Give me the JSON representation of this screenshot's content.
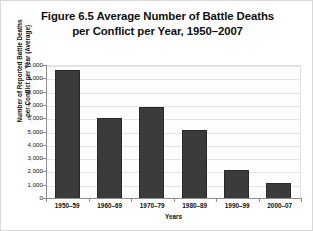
{
  "chart_data": {
    "type": "bar",
    "title": "Figure 6.5 Average Number of Battle Deaths per Conflict per Year, 1950–2007",
    "title_lines": [
      "Figure 6.5 Average Number of Battle Deaths",
      "per Conflict per Year, 1950–2007"
    ],
    "xlabel": "Years",
    "ylabel": "Number of Reported Battle Deaths per Conflict per Year (Average)",
    "ylabel_lines": [
      "Number of Reported Battle Deaths",
      "per Conflict per Year (Average)"
    ],
    "categories": [
      "1950–59",
      "1960–69",
      "1970–79",
      "1980–89",
      "1990–99",
      "2000–07"
    ],
    "values": [
      9700,
      6100,
      6900,
      5200,
      2200,
      1200
    ],
    "ylim": [
      0,
      10000
    ],
    "ytick_values": [
      0,
      1000,
      2000,
      3000,
      4000,
      5000,
      6000,
      7000,
      8000,
      9000,
      10000
    ],
    "ytick_labels": [
      "0",
      "1,000",
      "2,000",
      "3,000",
      "4,000",
      "5,000",
      "6,000",
      "7,000",
      "8,000",
      "9,000",
      "10,000"
    ],
    "grid": true,
    "legend": false,
    "series_color": "#3b3b3b",
    "grid_color": "#e4e4e4",
    "axis_color": "#8d8d8d",
    "background": "#ffffff"
  }
}
